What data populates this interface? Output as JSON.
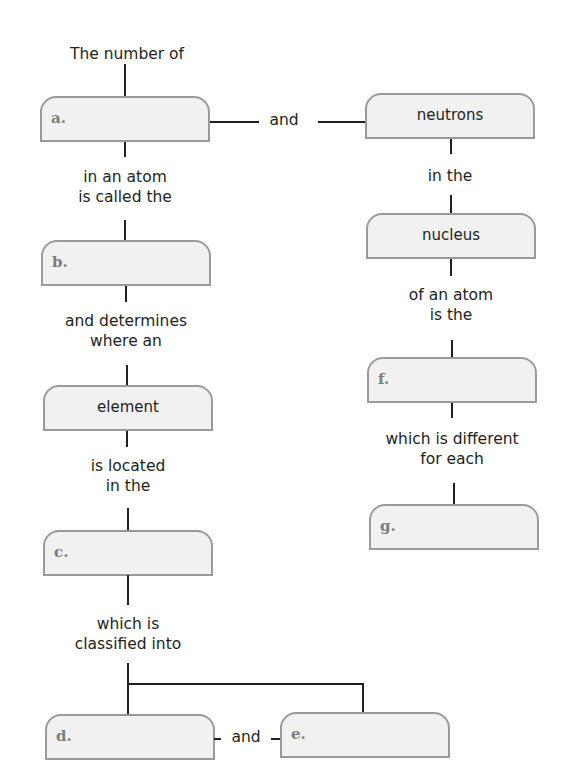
{
  "concept_map": {
    "left_column": {
      "intro": "The number of",
      "box_a": {
        "label": "a.",
        "answer": ""
      },
      "link_ab": "in an atom\nis called the",
      "box_b": {
        "label": "b.",
        "answer": ""
      },
      "link_b_element": "and determines\nwhere an",
      "box_element": {
        "term": "element"
      },
      "link_element_c": "is located\nin the",
      "box_c": {
        "label": "c.",
        "answer": ""
      },
      "link_c_de": "which is\nclassified into",
      "box_d": {
        "label": "d.",
        "answer": ""
      },
      "link_d_e": "and",
      "box_e": {
        "label": "e.",
        "answer": ""
      }
    },
    "link_a_neutrons": "and",
    "right_column": {
      "box_neutrons": {
        "term": "neutrons"
      },
      "link_neutrons_nucleus": "in the",
      "box_nucleus": {
        "term": "nucleus"
      },
      "link_nucleus_f": "of an atom\nis the",
      "box_f": {
        "label": "f.",
        "answer": ""
      },
      "link_f_g": "which is different\nfor each",
      "box_g": {
        "label": "g.",
        "answer": ""
      }
    }
  },
  "colors": {
    "box_fill": "#f1f1f1",
    "box_border": "#9a9a9a",
    "blank_label": "#7d7d7d",
    "text": "#231f20"
  }
}
